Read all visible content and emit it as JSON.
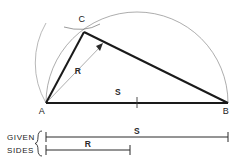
{
  "figure": {
    "colors": {
      "heavy_line": "#1a1a1a",
      "thin_line": "#555555",
      "construction_arc": "#777777",
      "text": "#1a1a1a",
      "background": "#ffffff"
    },
    "vertices": [
      {
        "name": "A",
        "label": "A",
        "x": 46,
        "y": 103,
        "label_x": 42,
        "label_y": 114
      },
      {
        "name": "B",
        "label": "B",
        "x": 228,
        "y": 103,
        "label_x": 224,
        "label_y": 114
      },
      {
        "name": "C",
        "label": "C",
        "x": 84,
        "y": 32,
        "label_x": 80,
        "label_y": 22
      }
    ],
    "dimensions": [
      {
        "name": "base-dimension",
        "label": "S",
        "x": 117,
        "y": 95
      },
      {
        "name": "radius-dimension",
        "label": "R",
        "x": 78,
        "y": 73
      }
    ],
    "semicircle": {
      "name": "semicircle-over-AB",
      "center_x": 137,
      "center_y": 103,
      "radius": 91,
      "start_x": 46,
      "start_y": 103,
      "end_x": 228,
      "end_y": 103
    },
    "radius_arc": {
      "name": "arc-radius-R-from-A",
      "center_x": 46,
      "center_y": 103,
      "radius": 80
    },
    "tick_mark": {
      "name": "midpoint-tick",
      "x": 137,
      "y": 103
    }
  },
  "legend": {
    "line1": "GIVEN",
    "line2": "SIDES",
    "brace": "{",
    "entries": [
      {
        "name": "given-side-S",
        "label": "S",
        "start_x": 46,
        "end_x": 228,
        "y": 137,
        "label_x": 137,
        "label_y": 132
      },
      {
        "name": "given-side-R",
        "label": "R",
        "start_x": 46,
        "end_x": 130,
        "y": 150,
        "label_x": 88,
        "label_y": 145
      }
    ]
  }
}
